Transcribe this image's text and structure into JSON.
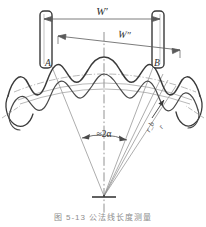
{
  "figure": {
    "title_caption": "图 5-13  公法线长度测量",
    "kind": "engineering-diagram",
    "background_color": "#ffffff",
    "line_color": "#3a3a3a",
    "thin_line_color": "#8a8a8a",
    "center_line_color": "#6d6d6d"
  },
  "labels": {
    "span_outer": "W′",
    "span_inner": "W″",
    "contact_point_left": "A",
    "contact_point_right": "B",
    "angle": "≈2α",
    "radius_base": "r_b",
    "radius_outer": "r"
  },
  "dimensions": {
    "outer_span_label": "W′",
    "inner_span_label": "W″",
    "angle_label": "≈2α"
  },
  "parts": {
    "caliper_jaw_left": "caliper-jaw-left",
    "caliper_jaw_right": "caliper-jaw-right",
    "gear_tooth_profile": "helical-gear-tooth-profile",
    "apex_vertex": "gear-axis-apex",
    "center_line": "vertical-center-line"
  }
}
